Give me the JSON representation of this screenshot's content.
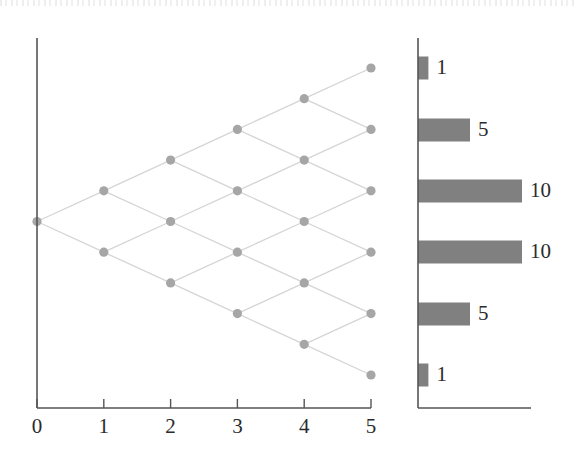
{
  "figure": {
    "width": 575,
    "height": 465,
    "background": "#ffffff",
    "node_color": "#a6a6a6",
    "edge_color": "#d5d5d5",
    "axis_color": "#555555",
    "bar_color": "#808080",
    "text_color": "#2b2b2b"
  },
  "chart_data": [
    {
      "type": "scatter",
      "name": "binomial-lattice",
      "title": "",
      "xlabel": "",
      "ylabel": "",
      "xlim": [
        0,
        5
      ],
      "ylim": [
        -5,
        5
      ],
      "grid": false,
      "legend": null,
      "xticks": [
        0,
        1,
        2,
        3,
        4,
        5
      ],
      "xtick_labels": [
        "0",
        "1",
        "2",
        "3",
        "4",
        "5"
      ],
      "yticks": [],
      "ytick_labels": [],
      "description": "Recombining binomial tree: from step 0 each node branches up (+1) and down (-1); nodes at step n occupy levels n, n-2, ..., -n.",
      "nodes": [
        {
          "x": 0,
          "y": 0
        },
        {
          "x": 1,
          "y": 1
        },
        {
          "x": 1,
          "y": -1
        },
        {
          "x": 2,
          "y": 2
        },
        {
          "x": 2,
          "y": 0
        },
        {
          "x": 2,
          "y": -2
        },
        {
          "x": 3,
          "y": 3
        },
        {
          "x": 3,
          "y": 1
        },
        {
          "x": 3,
          "y": -1
        },
        {
          "x": 3,
          "y": -3
        },
        {
          "x": 4,
          "y": 4
        },
        {
          "x": 4,
          "y": 2
        },
        {
          "x": 4,
          "y": 0
        },
        {
          "x": 4,
          "y": -2
        },
        {
          "x": 4,
          "y": -4
        },
        {
          "x": 5,
          "y": 5
        },
        {
          "x": 5,
          "y": 3
        },
        {
          "x": 5,
          "y": 1
        },
        {
          "x": 5,
          "y": -1
        },
        {
          "x": 5,
          "y": -3
        },
        {
          "x": 5,
          "y": -5
        }
      ],
      "edges": [
        {
          "x1": 0,
          "y1": 0,
          "x2": 1,
          "y2": 1
        },
        {
          "x1": 0,
          "y1": 0,
          "x2": 1,
          "y2": -1
        },
        {
          "x1": 1,
          "y1": 1,
          "x2": 2,
          "y2": 2
        },
        {
          "x1": 1,
          "y1": 1,
          "x2": 2,
          "y2": 0
        },
        {
          "x1": 1,
          "y1": -1,
          "x2": 2,
          "y2": 0
        },
        {
          "x1": 1,
          "y1": -1,
          "x2": 2,
          "y2": -2
        },
        {
          "x1": 2,
          "y1": 2,
          "x2": 3,
          "y2": 3
        },
        {
          "x1": 2,
          "y1": 2,
          "x2": 3,
          "y2": 1
        },
        {
          "x1": 2,
          "y1": 0,
          "x2": 3,
          "y2": 1
        },
        {
          "x1": 2,
          "y1": 0,
          "x2": 3,
          "y2": -1
        },
        {
          "x1": 2,
          "y1": -2,
          "x2": 3,
          "y2": -1
        },
        {
          "x1": 2,
          "y1": -2,
          "x2": 3,
          "y2": -3
        },
        {
          "x1": 3,
          "y1": 3,
          "x2": 4,
          "y2": 4
        },
        {
          "x1": 3,
          "y1": 3,
          "x2": 4,
          "y2": 2
        },
        {
          "x1": 3,
          "y1": 1,
          "x2": 4,
          "y2": 2
        },
        {
          "x1": 3,
          "y1": 1,
          "x2": 4,
          "y2": 0
        },
        {
          "x1": 3,
          "y1": -1,
          "x2": 4,
          "y2": 0
        },
        {
          "x1": 3,
          "y1": -1,
          "x2": 4,
          "y2": -2
        },
        {
          "x1": 3,
          "y1": -3,
          "x2": 4,
          "y2": -2
        },
        {
          "x1": 3,
          "y1": -3,
          "x2": 4,
          "y2": -4
        },
        {
          "x1": 4,
          "y1": 4,
          "x2": 5,
          "y2": 5
        },
        {
          "x1": 4,
          "y1": 4,
          "x2": 5,
          "y2": 3
        },
        {
          "x1": 4,
          "y1": 2,
          "x2": 5,
          "y2": 3
        },
        {
          "x1": 4,
          "y1": 2,
          "x2": 5,
          "y2": 1
        },
        {
          "x1": 4,
          "y1": 0,
          "x2": 5,
          "y2": 1
        },
        {
          "x1": 4,
          "y1": 0,
          "x2": 5,
          "y2": -1
        },
        {
          "x1": 4,
          "y1": -2,
          "x2": 5,
          "y2": -1
        },
        {
          "x1": 4,
          "y1": -2,
          "x2": 5,
          "y2": -3
        },
        {
          "x1": 4,
          "y1": -4,
          "x2": 5,
          "y2": -3
        },
        {
          "x1": 4,
          "y1": -4,
          "x2": 5,
          "y2": -5
        }
      ]
    },
    {
      "type": "bar",
      "name": "terminal-path-counts",
      "orientation": "horizontal",
      "title": "",
      "xlabel": "",
      "ylabel": "",
      "grid": false,
      "legend": null,
      "categories": [
        "5",
        "3",
        "1",
        "-1",
        "-3",
        "-5"
      ],
      "values": [
        1,
        5,
        10,
        10,
        5,
        1
      ],
      "data_labels": [
        "1",
        "5",
        "10",
        "10",
        "5",
        "1"
      ],
      "xlim": [
        0,
        12
      ],
      "xticks": [],
      "xtick_labels": [],
      "yticks": [],
      "ytick_labels": []
    }
  ],
  "lattice": {
    "x_axis": {
      "ticks": [
        {
          "label": "0",
          "value": 0
        },
        {
          "label": "1",
          "value": 1
        },
        {
          "label": "2",
          "value": 2
        },
        {
          "label": "3",
          "value": 3
        },
        {
          "label": "4",
          "value": 4
        },
        {
          "label": "5",
          "value": 5
        }
      ]
    }
  },
  "bars": {
    "items": [
      {
        "label": "1",
        "value": 1
      },
      {
        "label": "5",
        "value": 5
      },
      {
        "label": "10",
        "value": 10
      },
      {
        "label": "10",
        "value": 10
      },
      {
        "label": "5",
        "value": 5
      },
      {
        "label": "1",
        "value": 1
      }
    ]
  }
}
